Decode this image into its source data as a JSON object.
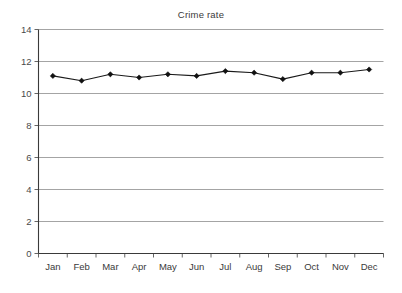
{
  "chart_data": {
    "type": "line",
    "title": "Crime rate",
    "xlabel": "",
    "ylabel": "",
    "categories": [
      "Jan",
      "Feb",
      "Mar",
      "Apr",
      "May",
      "Jun",
      "Jul",
      "Aug",
      "Sep",
      "Oct",
      "Nov",
      "Dec"
    ],
    "values": [
      11.1,
      10.8,
      11.2,
      11.0,
      11.2,
      11.1,
      11.4,
      11.3,
      10.9,
      11.3,
      11.3,
      11.5
    ],
    "series": [
      {
        "name": "Crime rate",
        "values": [
          11.1,
          10.8,
          11.2,
          11.0,
          11.2,
          11.1,
          11.4,
          11.3,
          10.9,
          11.3,
          11.3,
          11.5
        ]
      }
    ],
    "ylim": [
      0,
      14
    ],
    "ytick_step": 2,
    "yticks": [
      0,
      2,
      4,
      6,
      8,
      10,
      12,
      14
    ],
    "ytick_labels": [
      "0",
      "2",
      "4",
      "6",
      "8",
      "10",
      "12",
      "14"
    ],
    "grid": true,
    "grid_axis": "y",
    "legend": false,
    "legend_position": "none",
    "marker": "diamond",
    "line_color": "#1a1a1a",
    "marker_color": "#111111",
    "grid_color": "#9a9a9a",
    "axis_color": "#555555",
    "plot_background": "#ffffff"
  }
}
